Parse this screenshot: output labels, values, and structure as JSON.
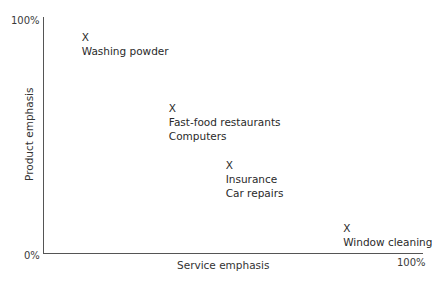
{
  "chart_data": {
    "type": "scatter",
    "title": "",
    "xlabel": "Service emphasis",
    "ylabel": "Product emphasis",
    "xlim": [
      0,
      100
    ],
    "ylim": [
      0,
      100
    ],
    "x_tick_labels": [
      "0%",
      "100%"
    ],
    "y_tick_labels": [
      "0%",
      "100%"
    ],
    "grid": false,
    "legend": null,
    "marker": "X",
    "points": [
      {
        "x": 11,
        "y": 91,
        "marker": "X",
        "labels": [
          "Washing powder"
        ]
      },
      {
        "x": 34,
        "y": 61,
        "marker": "X",
        "labels": [
          "Fast-food restaurants",
          "Computers"
        ]
      },
      {
        "x": 49,
        "y": 37,
        "marker": "X",
        "labels": [
          "Insurance",
          "Car repairs"
        ]
      },
      {
        "x": 80,
        "y": 10,
        "marker": "X",
        "labels": [
          "Window cleaning"
        ]
      }
    ]
  },
  "axes": {
    "origin_label": "0%",
    "y_max_label": "100%",
    "x_max_label": "100%",
    "x_title": "Service emphasis",
    "y_title": "Product emphasis"
  }
}
